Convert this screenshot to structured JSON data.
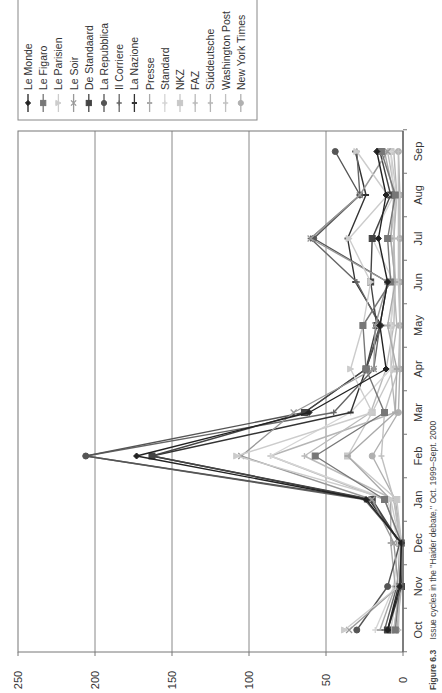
{
  "caption": {
    "label": "Figure 6.3",
    "text": "Issue cycles in the \"Haider debate,\" Oct. 1999–Sept. 2000"
  },
  "chart_data": {
    "type": "line",
    "title": "Issue cycles in the \"Haider debate,\" Oct. 1999–Sept. 2000",
    "xlabel": "",
    "ylabel": "",
    "orientation_note": "figure rotated 90° counter-clockwise in screenshot",
    "categories": [
      "Oct",
      "Nov",
      "Dec",
      "Jan",
      "Feb",
      "Mar",
      "Apr",
      "May",
      "Jun",
      "Jul",
      "Aug",
      "Sep"
    ],
    "ylim": [
      0,
      250
    ],
    "yticks": [
      0,
      50,
      100,
      150,
      200,
      250
    ],
    "grid": true,
    "legend_position": "right",
    "series": [
      {
        "name": "Le Monde",
        "color": "#222222",
        "marker": "diamond",
        "values": [
          10,
          2,
          1,
          24,
          173,
          61,
          11,
          15,
          10,
          16,
          11,
          17
        ]
      },
      {
        "name": "Le Figaro",
        "color": "#777777",
        "marker": "square",
        "values": [
          5,
          2,
          1,
          12,
          57,
          12,
          24,
          26,
          8,
          10,
          5,
          14
        ]
      },
      {
        "name": "Le Parisien",
        "color": "#cccccc",
        "marker": "triangle",
        "values": [
          38,
          3,
          2,
          8,
          108,
          20,
          34,
          26,
          21,
          35,
          10,
          30
        ]
      },
      {
        "name": "Le Soir",
        "color": "#999999",
        "marker": "x",
        "values": [
          35,
          3,
          6,
          20,
          105,
          71,
          19,
          18,
          10,
          60,
          28,
          10
        ]
      },
      {
        "name": "De Standaard",
        "color": "#444444",
        "marker": "square",
        "values": [
          10,
          1,
          2,
          20,
          163,
          64,
          24,
          17,
          21,
          20,
          8,
          15
        ]
      },
      {
        "name": "La Repubblica",
        "color": "#555555",
        "marker": "circle",
        "values": [
          30,
          10,
          2,
          21,
          206,
          64,
          24,
          15,
          10,
          58,
          28,
          44
        ]
      },
      {
        "name": "Il Corriere",
        "color": "#666666",
        "marker": "plus",
        "values": [
          12,
          4,
          1,
          25,
          206,
          45,
          19,
          15,
          30,
          60,
          28,
          30
        ]
      },
      {
        "name": "La Nazione",
        "color": "#333333",
        "marker": "bar",
        "values": [
          10,
          3,
          2,
          22,
          163,
          34,
          24,
          14,
          31,
          36,
          24,
          31
        ]
      },
      {
        "name": "Presse",
        "color": "#aaaaaa",
        "marker": "bar",
        "values": [
          15,
          5,
          8,
          8,
          36,
          5,
          4,
          10,
          5,
          8,
          6,
          12
        ]
      },
      {
        "name": "Standard",
        "color": "#d5d5d5",
        "marker": "plus",
        "values": [
          18,
          6,
          3,
          10,
          86,
          34,
          8,
          8,
          6,
          20,
          6,
          8
        ]
      },
      {
        "name": "NKZ",
        "color": "#c8c8c8",
        "marker": "square",
        "values": [
          8,
          3,
          1,
          4,
          36,
          20,
          6,
          8,
          5,
          8,
          4,
          8
        ]
      },
      {
        "name": "FAZ",
        "color": "#bbbbbb",
        "marker": "plus",
        "values": [
          6,
          2,
          2,
          6,
          64,
          21,
          11,
          6,
          5,
          6,
          5,
          10
        ]
      },
      {
        "name": "Süddeutsche",
        "color": "#b5b5b5",
        "marker": "plus",
        "values": [
          6,
          2,
          1,
          12,
          86,
          5,
          8,
          4,
          6,
          6,
          4,
          6
        ]
      },
      {
        "name": "Washington Post",
        "color": "#c0c0c0",
        "marker": "plus",
        "values": [
          3,
          2,
          1,
          6,
          14,
          12,
          3,
          2,
          3,
          3,
          3,
          3
        ]
      },
      {
        "name": "New York Times",
        "color": "#b0b0b0",
        "marker": "circle",
        "values": [
          4,
          1,
          1,
          5,
          20,
          3,
          2,
          2,
          2,
          2,
          2,
          3
        ]
      }
    ]
  }
}
